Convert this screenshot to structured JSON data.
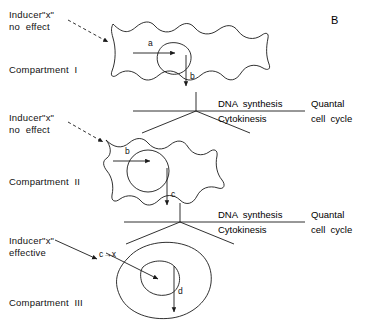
{
  "figure": {
    "panel_label": "B",
    "type": "cell-lineage-compartment-diagram"
  },
  "compartments": [
    {
      "id": "I",
      "name_label": "Compartment  I",
      "inducer": {
        "line1": "Inducer\"x\"",
        "line2": "no  effect",
        "arrow_style": "dashed",
        "effective": false
      },
      "cell_shape": "stellate",
      "arrows": [
        {
          "label": "a",
          "direction": "into-nucleus"
        },
        {
          "label": "b",
          "direction": "down-out"
        }
      ]
    },
    {
      "id": "II",
      "name_label": "Compartment  II",
      "inducer": {
        "line1": "Inducer\"x\"",
        "line2": "no  effect",
        "arrow_style": "dashed",
        "effective": false
      },
      "cell_shape": "stellate",
      "arrows": [
        {
          "label": "b",
          "direction": "into-nucleus"
        },
        {
          "label": "c",
          "direction": "down-out"
        }
      ]
    },
    {
      "id": "III",
      "name_label": "Compartment  III",
      "inducer": {
        "line1": "Inducer\"x\"",
        "line2": "effective",
        "arrow_style": "solid",
        "effective": true
      },
      "cell_shape": "rounded-oval",
      "arrows": [
        {
          "label": "c→x",
          "direction": "into-nucleus"
        },
        {
          "label": "d",
          "direction": "down-out"
        }
      ]
    }
  ],
  "dividers": [
    {
      "numerator": "DNA  synthesis",
      "denominator": "Cytokinesis",
      "caption_line1": "Quantal",
      "caption_line2": "cell  cycle"
    },
    {
      "numerator": "DNA  synthesis",
      "denominator": "Cytokinesis",
      "caption_line1": "Quantal",
      "caption_line2": "cell  cycle"
    }
  ],
  "style": {
    "stroke": "#1a1a1a",
    "background": "#ffffff"
  }
}
